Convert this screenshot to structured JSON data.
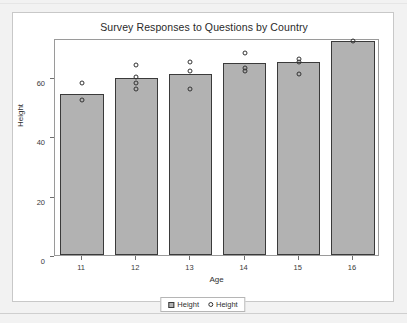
{
  "chart_data": {
    "type": "bar",
    "title": "Survey Responses to Questions by Country",
    "xlabel": "Age",
    "ylabel": "Height",
    "categories": [
      "11",
      "12",
      "13",
      "14",
      "15",
      "16"
    ],
    "values": [
      54,
      59.5,
      61,
      64.5,
      65,
      72
    ],
    "ylim": [
      0,
      73
    ],
    "yticks": [
      0,
      20,
      40,
      60
    ],
    "ytick_labels": [
      "0",
      "20",
      "40",
      "60"
    ],
    "grid": false,
    "legend_position": "bottom",
    "bar_color": "#b2b2b2",
    "bar_edge_color": "#3a3a3a",
    "point_edge_color": "#333333",
    "series": [
      {
        "name": "Height",
        "marker": "square",
        "type": "bar",
        "values": [
          54,
          59.5,
          61,
          64.5,
          65,
          72
        ]
      },
      {
        "name": "Height",
        "marker": "circle",
        "type": "scatter",
        "points": [
          {
            "x": "11",
            "y": 58
          },
          {
            "x": "11",
            "y": 52
          },
          {
            "x": "12",
            "y": 64
          },
          {
            "x": "12",
            "y": 60
          },
          {
            "x": "12",
            "y": 58
          },
          {
            "x": "12",
            "y": 56
          },
          {
            "x": "13",
            "y": 65
          },
          {
            "x": "13",
            "y": 62
          },
          {
            "x": "13",
            "y": 56
          },
          {
            "x": "14",
            "y": 68
          },
          {
            "x": "14",
            "y": 63
          },
          {
            "x": "14",
            "y": 62
          },
          {
            "x": "15",
            "y": 66
          },
          {
            "x": "15",
            "y": 65
          },
          {
            "x": "15",
            "y": 61
          },
          {
            "x": "16",
            "y": 72
          }
        ]
      }
    ]
  },
  "legend": {
    "entries": [
      {
        "label": "Height",
        "marker": "square"
      },
      {
        "label": "Height",
        "marker": "circle"
      }
    ]
  }
}
